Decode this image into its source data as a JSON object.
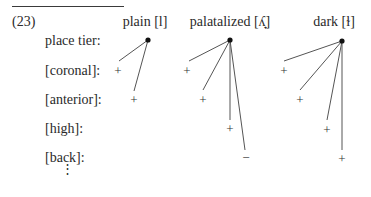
{
  "example_number": "(23)",
  "columns": [
    {
      "label": "plain [l]"
    },
    {
      "label": "palatalized [ʎ̟]"
    },
    {
      "label": "dark [ɫ]"
    }
  ],
  "rows": [
    {
      "label": "place tier:"
    },
    {
      "label": "[coronal]:"
    },
    {
      "label": "[anterior]:"
    },
    {
      "label": "[high]:"
    },
    {
      "label": "[back]:"
    }
  ],
  "continuation": "⋮",
  "values": {
    "plain": {
      "coronal": "+",
      "anterior": "+"
    },
    "palatalized": {
      "coronal": "+",
      "anterior": "+",
      "high": "+",
      "back": "−"
    },
    "dark": {
      "coronal": "+",
      "anterior": "+",
      "high": "+",
      "back": "+"
    }
  },
  "colors": {
    "ink": "#2a2a2a",
    "line": "#555555"
  }
}
